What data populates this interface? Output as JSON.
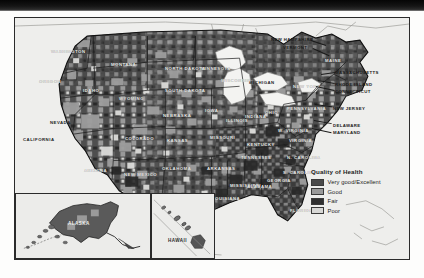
{
  "figure": {
    "kind": "choropleth-map",
    "legend": {
      "title": "Quality of Health",
      "entries": [
        {
          "label": "Very good/Excellent",
          "color": "#4a4a4a"
        },
        {
          "label": "Good",
          "color": "#9a9a9a"
        },
        {
          "label": "Fair",
          "color": "#303030"
        },
        {
          "label": "Poor",
          "color": "#d8d8d6"
        }
      ]
    },
    "insets": [
      {
        "name": "alaska",
        "label": "ALASKA"
      },
      {
        "name": "hawaii",
        "label": "HAWAII"
      }
    ],
    "state_labels": [
      {
        "name": "washington",
        "text": "WASHINGTON",
        "x": 36,
        "y": 31,
        "tone": "light"
      },
      {
        "name": "oregon",
        "text": "OREGON",
        "x": 24,
        "y": 61,
        "tone": "light"
      },
      {
        "name": "idaho",
        "text": "IDAHO",
        "x": 68,
        "y": 70,
        "tone": "light"
      },
      {
        "name": "montana",
        "text": "MONTANA",
        "x": 96,
        "y": 44,
        "tone": "light"
      },
      {
        "name": "wyoming",
        "text": "WYOMING",
        "x": 104,
        "y": 78,
        "tone": "light"
      },
      {
        "name": "nevada",
        "text": "NEVADA",
        "x": 35,
        "y": 102,
        "tone": "dark"
      },
      {
        "name": "california",
        "text": "CALIFORNIA",
        "x": 8,
        "y": 119,
        "tone": "dark"
      },
      {
        "name": "colorado",
        "text": "COLORADO",
        "x": 110,
        "y": 118,
        "tone": "light"
      },
      {
        "name": "arizona",
        "text": "ARIZONA",
        "x": 69,
        "y": 150,
        "tone": "light"
      },
      {
        "name": "newmexico",
        "text": "NEW MEXICO",
        "x": 109,
        "y": 154,
        "tone": "light"
      },
      {
        "name": "texas",
        "text": "TEXAS",
        "x": 155,
        "y": 183,
        "tone": "light"
      },
      {
        "name": "oklahoma",
        "text": "OKLAHOMA",
        "x": 147,
        "y": 148,
        "tone": "light"
      },
      {
        "name": "kansas",
        "text": "KANSAS",
        "x": 152,
        "y": 120,
        "tone": "light"
      },
      {
        "name": "nebraska",
        "text": "NEBRASKA",
        "x": 148,
        "y": 95,
        "tone": "light"
      },
      {
        "name": "southdakota",
        "text": "SOUTH DAKOTA",
        "x": 150,
        "y": 70,
        "tone": "light"
      },
      {
        "name": "northdakota",
        "text": "NORTH DAKOTA",
        "x": 150,
        "y": 48,
        "tone": "light"
      },
      {
        "name": "minnesota",
        "text": "MINNESOTA",
        "x": 186,
        "y": 48,
        "tone": "light"
      },
      {
        "name": "iowa",
        "text": "IOWA",
        "x": 190,
        "y": 90,
        "tone": "light"
      },
      {
        "name": "missouri",
        "text": "MISSOURI",
        "x": 195,
        "y": 117,
        "tone": "light"
      },
      {
        "name": "arkansas",
        "text": "ARKANSAS",
        "x": 192,
        "y": 148,
        "tone": "light"
      },
      {
        "name": "louisiana",
        "text": "LOUISIANA",
        "x": 197,
        "y": 178,
        "tone": "light"
      },
      {
        "name": "mississippi",
        "text": "MISSISSIPPI",
        "x": 215,
        "y": 165,
        "tone": "light"
      },
      {
        "name": "alabama",
        "text": "ALABAMA",
        "x": 232,
        "y": 166,
        "tone": "light"
      },
      {
        "name": "georgia",
        "text": "GEORGIA",
        "x": 252,
        "y": 160,
        "tone": "light"
      },
      {
        "name": "florida",
        "text": "FLORIDA",
        "x": 275,
        "y": 190,
        "tone": "light"
      },
      {
        "name": "tennessee",
        "text": "TENNESSEE",
        "x": 226,
        "y": 137,
        "tone": "light"
      },
      {
        "name": "kentucky",
        "text": "KENTUCKY",
        "x": 232,
        "y": 124,
        "tone": "light"
      },
      {
        "name": "illinois",
        "text": "ILLINOIS",
        "x": 211,
        "y": 100,
        "tone": "light"
      },
      {
        "name": "indiana",
        "text": "INDIANA",
        "x": 230,
        "y": 96,
        "tone": "light"
      },
      {
        "name": "ohio",
        "text": "OHIO",
        "x": 250,
        "y": 92,
        "tone": "light"
      },
      {
        "name": "michigan",
        "text": "MICHIGAN",
        "x": 234,
        "y": 62,
        "tone": "dark"
      },
      {
        "name": "wisconsin",
        "text": "WISCONSIN",
        "x": 206,
        "y": 60,
        "tone": "light"
      },
      {
        "name": "westvirginia",
        "text": "W. VIRGINIA",
        "x": 263,
        "y": 110,
        "tone": "light"
      },
      {
        "name": "virginia",
        "text": "VIRGINIA",
        "x": 274,
        "y": 120,
        "tone": "light"
      },
      {
        "name": "northcarolina",
        "text": "N. CAROLINA",
        "x": 272,
        "y": 137,
        "tone": "light"
      },
      {
        "name": "southcarolina",
        "text": "S. CAROLINA",
        "x": 268,
        "y": 152,
        "tone": "light"
      },
      {
        "name": "pennsylvania",
        "text": "PENNSYLVANIA",
        "x": 272,
        "y": 88,
        "tone": "light"
      },
      {
        "name": "newyork",
        "text": "NEW YORK",
        "x": 278,
        "y": 66,
        "tone": "light"
      },
      {
        "name": "maine",
        "text": "MAINE",
        "x": 310,
        "y": 40,
        "tone": "light"
      }
    ],
    "callouts": [
      {
        "name": "new-hampshire",
        "text": "NEW HAMPSHIRE",
        "x": 256,
        "y": 19
      },
      {
        "name": "vermont",
        "text": "VERMONT",
        "x": 268,
        "y": 27
      },
      {
        "name": "massachusetts",
        "text": "MASSACHUSETTS",
        "x": 320,
        "y": 52
      },
      {
        "name": "rhode-island",
        "text": "RHODE ISLAND",
        "x": 320,
        "y": 64
      },
      {
        "name": "connecticut",
        "text": "CONNECTICUT",
        "x": 320,
        "y": 71
      },
      {
        "name": "new-jersey",
        "text": "NEW JERSEY",
        "x": 318,
        "y": 88
      },
      {
        "name": "delaware",
        "text": "DELAWARE",
        "x": 318,
        "y": 105
      },
      {
        "name": "maryland",
        "text": "MARYLAND",
        "x": 318,
        "y": 112
      }
    ]
  }
}
